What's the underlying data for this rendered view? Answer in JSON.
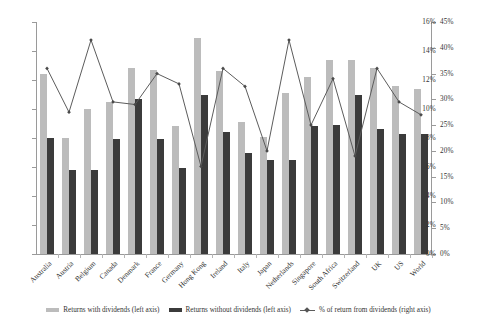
{
  "chart_data": {
    "type": "bar",
    "title": "",
    "xlabel": "",
    "ylabel": "",
    "ylim": [
      0,
      16
    ],
    "ylim_right": [
      0,
      45
    ],
    "grid": false,
    "legend_position": "bottom",
    "categories": [
      "Australia",
      "Austria",
      "Belgium",
      "Canada",
      "Denmark",
      "France",
      "Germany",
      "Hong Kong",
      "Ireland",
      "Italy",
      "Japan",
      "Netherlands",
      "Singapore",
      "South Africa",
      "Switzerland",
      "UK",
      "US",
      "World"
    ],
    "left_axis_ticks": [
      "0%",
      "2%",
      "4%",
      "6%",
      "8%",
      "10%",
      "12%",
      "14%",
      "16%"
    ],
    "right_axis_ticks": [
      "0%",
      "5%",
      "10%",
      "15%",
      "20%",
      "25%",
      "30%",
      "35%",
      "40%",
      "45%"
    ],
    "series": [
      {
        "name": "Returns with dividends (left axis)",
        "axis": "left",
        "type": "bar",
        "color": "#bcbcbc",
        "values": [
          12.4,
          8.0,
          10.0,
          10.5,
          12.8,
          12.7,
          8.8,
          14.9,
          12.6,
          9.1,
          8.1,
          11.1,
          12.2,
          13.4,
          13.4,
          12.8,
          11.6,
          11.4
        ]
      },
      {
        "name": "Returns without dividends (left axis)",
        "axis": "left",
        "type": "bar",
        "color": "#3b3b3b",
        "values": [
          8.0,
          5.8,
          5.8,
          7.9,
          10.7,
          7.9,
          5.9,
          11.0,
          8.4,
          7.0,
          6.5,
          6.5,
          8.8,
          8.9,
          11.0,
          8.6,
          8.3,
          8.3
        ]
      },
      {
        "name": "% of return from dividends (right axis)",
        "axis": "right",
        "type": "line",
        "color": "#5c5c5c",
        "values": [
          36.0,
          27.5,
          41.5,
          29.5,
          29.0,
          35.0,
          33.0,
          17.0,
          36.0,
          32.5,
          20.0,
          41.5,
          25.0,
          34.0,
          19.0,
          36.0,
          29.5,
          27.0
        ]
      }
    ]
  },
  "legend": {
    "items": [
      {
        "label": "Returns with dividends (left axis)",
        "marker": "swatch-light"
      },
      {
        "label": "Returns without dividends (left axis)",
        "marker": "swatch-dark"
      },
      {
        "label": "% of return from dividends (right axis)",
        "marker": "line-marker"
      }
    ]
  }
}
